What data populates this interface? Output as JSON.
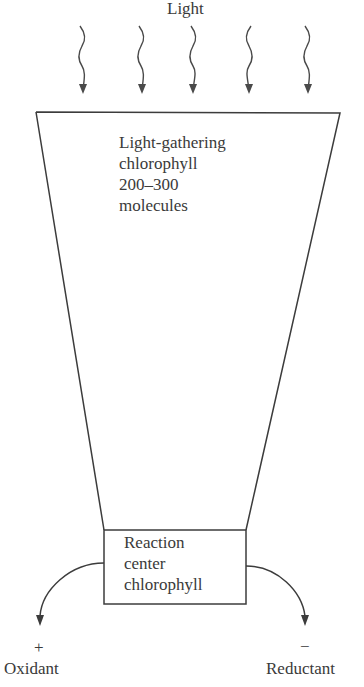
{
  "diagram": {
    "light_label": "Light",
    "light_arrows_count": 5,
    "antenna": {
      "lines": [
        "Light-gathering",
        "chlorophyll",
        "200–300",
        "molecules"
      ]
    },
    "reaction_center": {
      "lines": [
        "Reaction",
        "center",
        "chlorophyll"
      ]
    },
    "outputs": {
      "left": {
        "sign": "+",
        "label": "Oxidant"
      },
      "right": {
        "sign": "−",
        "label": "Reductant"
      }
    },
    "colors": {
      "line": "#3c3c3c",
      "text": "#3a3a3a",
      "background": "#ffffff"
    }
  }
}
